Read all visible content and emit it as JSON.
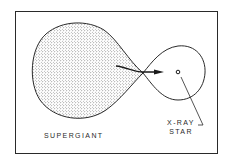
{
  "diagram": {
    "title": "",
    "labels": {
      "supergiant": "SUPERGIANT",
      "xray_line1": "X-RAY",
      "xray_line2": "STAR"
    },
    "nodes": [
      {
        "id": "supergiant",
        "label": "SUPERGIANT",
        "shape": "teardrop-lobe",
        "fill": "stippled"
      },
      {
        "id": "xray-star",
        "label": "X-RAY STAR",
        "shape": "small-circle-in-lobe",
        "fill": "none"
      }
    ],
    "edges": [
      {
        "from": "supergiant",
        "to": "xray-star",
        "type": "mass-transfer-arrow",
        "via": "inner-lagrangian-point"
      }
    ],
    "colors": {
      "line": "#2a2a2a",
      "stipple": "#3a3a3a",
      "background": "#ffffff"
    }
  }
}
